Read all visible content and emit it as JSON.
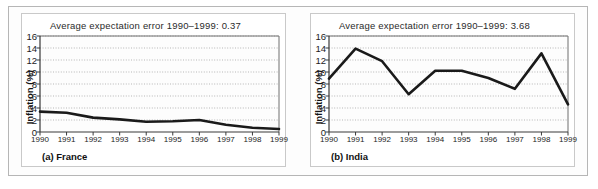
{
  "figure": {
    "panel_count": 2,
    "frame_color": "#b6b6b6"
  },
  "chart_data": [
    {
      "type": "line",
      "title": "Average expectation error 1990–1999: 0.37",
      "caption": "(a) France",
      "xlabel": "",
      "ylabel": "Inflation (%)",
      "categories": [
        "1990",
        "1991",
        "1992",
        "1993",
        "1994",
        "1995",
        "1996",
        "1997",
        "1998",
        "1999"
      ],
      "values": [
        3.4,
        3.2,
        2.4,
        2.1,
        1.7,
        1.8,
        2.0,
        1.2,
        0.7,
        0.5
      ],
      "ylim": [
        0,
        16
      ],
      "yticks": [
        0,
        2,
        4,
        6,
        8,
        10,
        12,
        14,
        16
      ],
      "grid": true,
      "legend": "none",
      "line_color": "#1a1a1a",
      "plot_bg": "#fdfdfd"
    },
    {
      "type": "line",
      "title": "Average expectation error 1990–1999: 3.68",
      "caption": "(b) India",
      "xlabel": "",
      "ylabel": "Inflation (%)",
      "categories": [
        "1990",
        "1991",
        "1992",
        "1993",
        "1994",
        "1995",
        "1996",
        "1997",
        "1998",
        "1999"
      ],
      "values": [
        8.9,
        13.9,
        11.8,
        6.3,
        10.2,
        10.2,
        9.0,
        7.2,
        13.1,
        4.6
      ],
      "ylim": [
        0,
        16
      ],
      "yticks": [
        0,
        2,
        4,
        6,
        8,
        10,
        12,
        14,
        16
      ],
      "grid": true,
      "legend": "none",
      "line_color": "#1a1a1a",
      "plot_bg": "#fdfdfd"
    }
  ]
}
